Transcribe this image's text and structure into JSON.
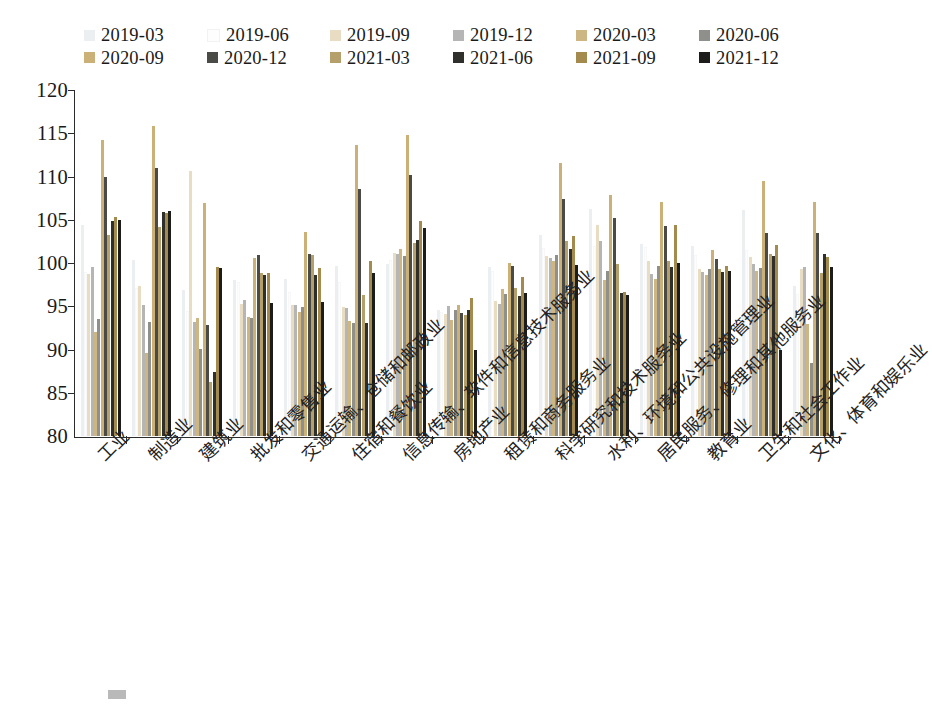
{
  "chart_data": {
    "type": "bar",
    "title": "",
    "subtitle": "",
    "xlabel": "",
    "ylabel": "",
    "ylim": [
      80,
      120
    ],
    "yticks": [
      80,
      85,
      90,
      95,
      100,
      105,
      110,
      115,
      120
    ],
    "grid": false,
    "legend_position": "top",
    "legend_columns": 6,
    "categories": [
      "工业",
      "制造业",
      "建筑业",
      "批发和零售业",
      "交通运输、仓储和邮政业",
      "住宿和餐饮业",
      "信息传输、软件和信息技术服务业",
      "房地产业",
      "租赁和商务服务业",
      "科学研究和技术服务业",
      "水利、环境和公共设施管理业",
      "居民服务、修理和其他服务业",
      "教育业",
      "卫生和社会工作业",
      "文化、体育和娱乐业"
    ],
    "series": [
      {
        "name": "2019-03",
        "color": "#eceff1",
        "values": [
          104.4,
          100.3,
          96.9,
          98.0,
          98.2,
          99.6,
          99.9,
          94.6,
          99.5,
          103.2,
          106.3,
          102.2,
          102.0,
          106.1,
          97.3
        ]
      },
      {
        "name": "2019-06",
        "color": "#fdfdfd",
        "values": [
          99.0,
          97.1,
          94.5,
          97.8,
          96.6,
          97.8,
          100.4,
          94.3,
          99.1,
          101.7,
          102.0,
          101.8,
          100.9,
          101.5,
          96.4
        ]
      },
      {
        "name": "2019-09",
        "color": "#e8dcc2",
        "values": [
          98.7,
          97.3,
          110.6,
          95.3,
          95.1,
          94.9,
          101.2,
          94.1,
          95.6,
          100.8,
          104.4,
          100.2,
          99.3,
          100.7,
          99.3
        ]
      },
      {
        "name": "2019-12",
        "color": "#b5b5b5",
        "values": [
          99.5,
          95.1,
          93.2,
          95.7,
          95.1,
          94.8,
          101.0,
          95.0,
          95.3,
          100.6,
          102.6,
          98.7,
          99.0,
          99.9,
          99.5
        ]
      },
      {
        "name": "2020-03",
        "color": "#cdb681",
        "values": [
          92.0,
          89.6,
          93.7,
          93.8,
          94.3,
          93.3,
          101.6,
          93.4,
          97.0,
          100.2,
          98.0,
          98.2,
          98.6,
          99.1,
          92.9
        ]
      },
      {
        "name": "2020-06",
        "color": "#8f8f8b",
        "values": [
          93.5,
          93.2,
          90.1,
          93.6,
          94.9,
          93.1,
          100.8,
          94.6,
          96.4,
          100.9,
          99.1,
          99.7,
          99.3,
          99.4,
          88.4
        ]
      },
      {
        "name": "2020-09",
        "color": "#cbb078",
        "values": [
          114.2,
          115.8,
          106.9,
          100.6,
          103.6,
          113.6,
          114.8,
          95.1,
          100.0,
          111.6,
          107.9,
          107.1,
          101.5,
          109.5,
          107.1
        ]
      },
      {
        "name": "2020-12",
        "color": "#4a4a46",
        "values": [
          110.0,
          111.0,
          92.8,
          100.9,
          101.0,
          108.5,
          110.2,
          94.2,
          99.6,
          107.4,
          105.2,
          104.3,
          100.5,
          103.5,
          103.5
        ]
      },
      {
        "name": "2021-03",
        "color": "#b59f6b",
        "values": [
          103.2,
          104.2,
          86.2,
          98.9,
          100.9,
          96.3,
          102.3,
          94.0,
          97.1,
          102.6,
          99.9,
          100.2,
          99.3,
          101.0,
          98.9
        ]
      },
      {
        "name": "2021-06",
        "color": "#2f2f2c",
        "values": [
          104.9,
          105.9,
          87.4,
          98.6,
          98.6,
          93.1,
          102.7,
          94.6,
          96.2,
          101.6,
          96.5,
          99.5,
          99.0,
          100.8,
          101.0
        ]
      },
      {
        "name": "2021-09",
        "color": "#a58a4e",
        "values": [
          105.3,
          105.8,
          99.5,
          98.8,
          99.4,
          100.2,
          104.9,
          96.0,
          98.4,
          103.1,
          96.7,
          104.4,
          99.7,
          102.1,
          100.7
        ]
      },
      {
        "name": "2021-12",
        "color": "#1c1c1a",
        "values": [
          105.0,
          106.0,
          99.4,
          95.4,
          95.5,
          98.8,
          104.1,
          89.9,
          96.5,
          99.8,
          96.3,
          100.0,
          99.1,
          90.0,
          99.5
        ]
      }
    ]
  },
  "legend": {
    "items": [
      {
        "label": "2019-03",
        "color": "#eceff1"
      },
      {
        "label": "2019-06",
        "color": "#fdfdfd"
      },
      {
        "label": "2019-09",
        "color": "#e8dcc2"
      },
      {
        "label": "2019-12",
        "color": "#b5b5b5"
      },
      {
        "label": "2020-03",
        "color": "#cdb681"
      },
      {
        "label": "2020-06",
        "color": "#8f8f8b"
      },
      {
        "label": "2020-09",
        "color": "#cbb078"
      },
      {
        "label": "2020-12",
        "color": "#4a4a46"
      },
      {
        "label": "2021-03",
        "color": "#b59f6b"
      },
      {
        "label": "2021-06",
        "color": "#2f2f2c"
      },
      {
        "label": "2021-09",
        "color": "#a58a4e"
      },
      {
        "label": "2021-12",
        "color": "#1c1c1a"
      }
    ]
  },
  "caption": {
    "text": ""
  }
}
